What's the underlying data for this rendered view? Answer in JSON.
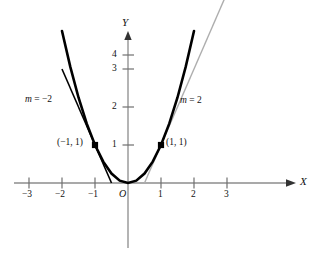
{
  "figure": {
    "name": "parabola-with-tangent-lines",
    "axis_x_label": "X",
    "axis_y_label": "Y",
    "origin_label": "O"
  },
  "chart_data": {
    "type": "line",
    "title": "",
    "xlabel": "X",
    "ylabel": "Y",
    "xlim": [
      -3.6,
      3.9
    ],
    "ylim": [
      -1.1,
      4.6
    ],
    "grid": false,
    "legend": "none",
    "x_ticks": [
      -3,
      -2,
      -1,
      1,
      2,
      3
    ],
    "x_tick_labels": [
      "−3",
      "−2",
      "−1",
      "1",
      "2",
      "3"
    ],
    "y_ticks": [
      1,
      2,
      3,
      4
    ],
    "y_tick_labels": [
      "1",
      "2",
      "3",
      "4"
    ],
    "series": [
      {
        "name": "parabola",
        "equation": "y = x^2",
        "color": "#000000",
        "width": 2.6,
        "x": [
          -2.0,
          -1.75,
          -1.5,
          -1.25,
          -1.0,
          -0.75,
          -0.5,
          -0.25,
          0.0,
          0.25,
          0.5,
          0.75,
          1.0,
          1.25,
          1.5,
          1.75,
          2.0
        ],
        "y": [
          4.0,
          3.0625,
          2.25,
          1.5625,
          1.0,
          0.5625,
          0.25,
          0.0625,
          0.0,
          0.0625,
          0.25,
          0.5625,
          1.0,
          1.5625,
          2.25,
          3.0625,
          4.0
        ]
      },
      {
        "name": "tangent-left",
        "equation": "y = -2x - 1",
        "slope": -2,
        "point": [
          -1,
          1
        ],
        "color": "#000000",
        "width": 1.6,
        "x": [
          -2.0,
          -0.5
        ],
        "y": [
          3.0,
          0.0
        ]
      },
      {
        "name": "tangent-right",
        "equation": "y = 2x - 1",
        "slope": 2,
        "point": [
          1,
          1
        ],
        "color": "#aeaeae",
        "width": 1.4,
        "x": [
          0.5,
          3.05
        ],
        "y": [
          0.0,
          5.1
        ]
      }
    ],
    "points": [
      {
        "name": "point-left",
        "x": -1,
        "y": 1,
        "label": "(−1, 1)"
      },
      {
        "name": "point-right",
        "x": 1,
        "y": 1,
        "label": "(1, 1)"
      }
    ],
    "annotations": [
      {
        "name": "slope-label-left",
        "text_m": "m",
        "text_eq": " = −2",
        "x": -2.55,
        "y": 2.35
      },
      {
        "name": "slope-label-right",
        "text_m": "m",
        "text_eq": " = 2",
        "x": 1.35,
        "y": 2.3
      }
    ],
    "colors": {
      "axis": "#8c8c8c",
      "curve": "#000000",
      "tangent_left": "#000000",
      "tangent_right": "#aeaeae",
      "text": "#111111"
    }
  }
}
